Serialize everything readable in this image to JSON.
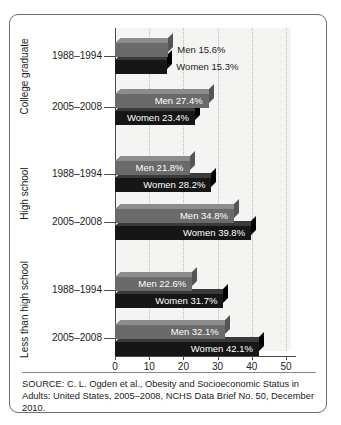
{
  "figure": {
    "source_note": "SOURCE: C. L. Ogden et al., Obesity and Socioeconomic Status in Adults: United States, 2005–2008, NCHS Data Brief No. 50, December 2010."
  },
  "chart_data": {
    "type": "bar",
    "orientation": "horizontal",
    "title": "",
    "xlabel": "",
    "ylabel": "",
    "xlim": [
      0,
      50
    ],
    "xticks": [
      0,
      10,
      20,
      30,
      40,
      50
    ],
    "xticklabels": [
      "0",
      "10",
      "20",
      "30",
      "40",
      "50"
    ],
    "grid": "vertical-dotted",
    "legend": "none",
    "value_suffix": "%",
    "colors": {
      "men": "#6a6a6a",
      "women": "#161616",
      "plot_background": "#f4f4f3",
      "gridline": "#b9b9b9",
      "axis": "#4a4a4a",
      "border": "#6f6f6f"
    },
    "categories": [
      {
        "name": "College graduate",
        "groups": [
          {
            "period": "1988–1994",
            "bars": [
              {
                "series": "Men",
                "value": 15.6,
                "label": "Men 15.6%",
                "label_position": "outside"
              },
              {
                "series": "Women",
                "value": 15.3,
                "label": "Women 15.3%",
                "label_position": "outside"
              }
            ]
          },
          {
            "period": "2005–2008",
            "bars": [
              {
                "series": "Men",
                "value": 27.4,
                "label": "Men 27.4%",
                "label_position": "inside"
              },
              {
                "series": "Women",
                "value": 23.4,
                "label": "Women 23.4%",
                "label_position": "inside"
              }
            ]
          }
        ]
      },
      {
        "name": "High school",
        "groups": [
          {
            "period": "1988–1994",
            "bars": [
              {
                "series": "Men",
                "value": 21.8,
                "label": "Men 21.8%",
                "label_position": "inside"
              },
              {
                "series": "Women",
                "value": 28.2,
                "label": "Women 28.2%",
                "label_position": "inside"
              }
            ]
          },
          {
            "period": "2005–2008",
            "bars": [
              {
                "series": "Men",
                "value": 34.8,
                "label": "Men 34.8%",
                "label_position": "inside"
              },
              {
                "series": "Women",
                "value": 39.8,
                "label": "Women 39.8%",
                "label_position": "inside"
              }
            ]
          }
        ]
      },
      {
        "name": "Less than high school",
        "groups": [
          {
            "period": "1988–1994",
            "bars": [
              {
                "series": "Men",
                "value": 22.6,
                "label": "Men 22.6%",
                "label_position": "inside"
              },
              {
                "series": "Women",
                "value": 31.7,
                "label": "Women 31.7%",
                "label_position": "inside"
              }
            ]
          },
          {
            "period": "2005–2008",
            "bars": [
              {
                "series": "Men",
                "value": 32.1,
                "label": "Men 32.1%",
                "label_position": "inside"
              },
              {
                "series": "Women",
                "value": 42.1,
                "label": "Women 42.1%",
                "label_position": "inside"
              }
            ]
          }
        ]
      }
    ]
  }
}
